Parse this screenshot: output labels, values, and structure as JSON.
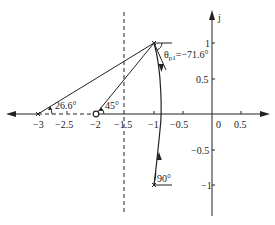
{
  "diagram": {
    "type": "root-locus",
    "axis": {
      "imag_label": "j",
      "real_ticks": [
        "−3",
        "−2.5",
        "−2",
        "−1.5",
        "−1",
        "−0.5",
        "0",
        "0.5"
      ],
      "imag_ticks": [
        "1",
        "0.5",
        "−0.5",
        "−1"
      ]
    },
    "annotations": {
      "angle_zero": "45°",
      "angle_pole3": "26.6°",
      "departure_angle": "θ",
      "departure_sub": "p1",
      "departure_value": "=−71.6°",
      "angle_conj": "90°"
    },
    "elements": {
      "poles": [
        "-1+j1",
        "-1-j1",
        "-3"
      ],
      "zeros": [
        "-2"
      ],
      "asymptote": "-1.5"
    },
    "colors": {
      "line": "#222222",
      "background": "#ffffff"
    }
  }
}
